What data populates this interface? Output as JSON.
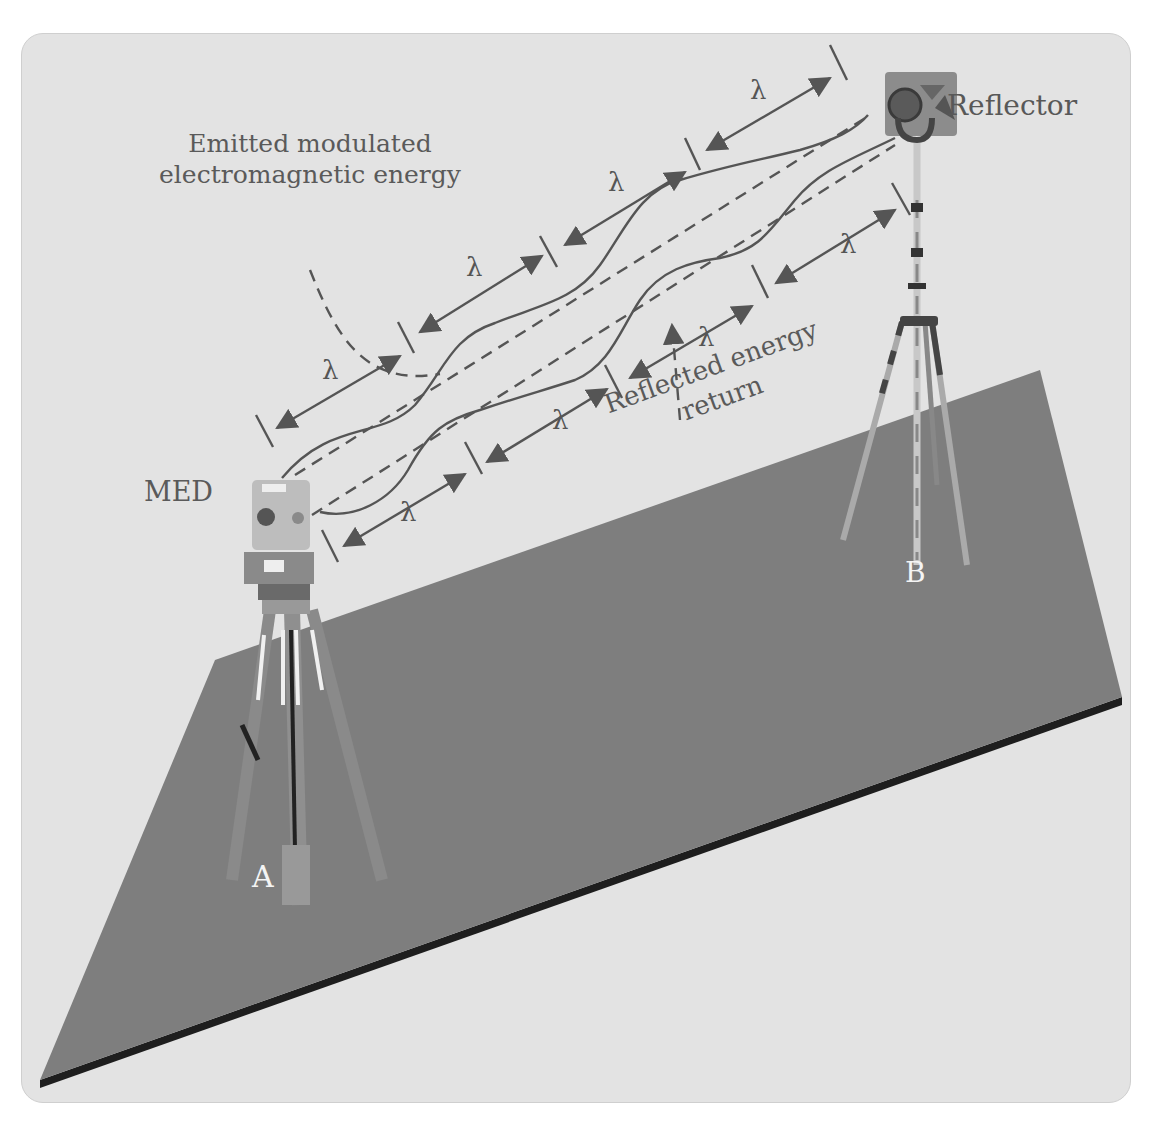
{
  "figure": {
    "labels": {
      "emitted_line1": "Emitted modulated",
      "emitted_line2": "electromagnetic energy",
      "reflector": "Reflector",
      "med": "MED",
      "reflected_line1": "Reflected energy",
      "reflected_line2": "return",
      "point_a": "A",
      "point_b": "B"
    },
    "wavelength_symbol": "λ",
    "wavelength_marks": [
      {
        "id": "out-1",
        "x": 322,
        "y": 368
      },
      {
        "id": "out-2",
        "x": 466,
        "y": 265
      },
      {
        "id": "out-3",
        "x": 608,
        "y": 180
      },
      {
        "id": "out-4",
        "x": 750,
        "y": 88
      },
      {
        "id": "ret-1",
        "x": 400,
        "y": 510
      },
      {
        "id": "ret-2",
        "x": 552,
        "y": 418
      },
      {
        "id": "ret-3",
        "x": 698,
        "y": 335
      },
      {
        "id": "ret-4",
        "x": 840,
        "y": 242
      }
    ],
    "colors": {
      "background": "#e3e3e3",
      "plane": "#7e7e7e",
      "plane_edge": "#1e1e1e",
      "lines": "#555555",
      "label_text": "#5a5a5a",
      "point_label": "#f4f4f4"
    }
  }
}
